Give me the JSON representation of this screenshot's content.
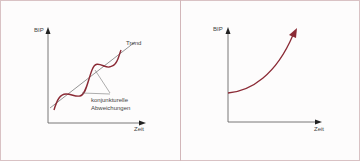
{
  "colors": {
    "curve": "#8b2a35",
    "axis": "#333333",
    "trend": "#555555",
    "border": "#d2b6b9"
  },
  "left_diagram": {
    "y_axis_label": "BIP",
    "x_axis_label": "Zeit",
    "trend_label": "Trend",
    "annotation_line1": "konjunkturelle",
    "annotation_line2": "Abweichungen"
  },
  "right_diagram": {
    "y_axis_label": "BIP",
    "x_axis_label": "Zeit"
  }
}
